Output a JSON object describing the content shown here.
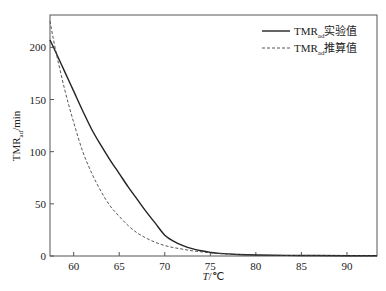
{
  "chart_data": {
    "type": "line",
    "title": "",
    "xlabel": "T/℃",
    "ylabel": "TMRad/min",
    "xlim": [
      57.4,
      93.3
    ],
    "ylim": [
      0,
      231
    ],
    "xticks": [
      60,
      65,
      70,
      75,
      80,
      85,
      90
    ],
    "yticks": [
      0,
      50,
      100,
      150,
      200
    ],
    "grid": false,
    "legend_position": "upper right",
    "series": [
      {
        "name": "TMRad实验值",
        "style": "solid",
        "color": "#222222",
        "x": [
          57.4,
          58,
          59,
          60,
          61,
          62,
          63,
          64,
          65,
          66,
          67,
          68,
          69,
          70,
          71,
          72,
          73,
          74,
          75,
          76,
          78,
          80,
          85,
          90,
          93.3
        ],
        "y": [
          207,
          196,
          177,
          158,
          139,
          121,
          106,
          92,
          79,
          66,
          54,
          42,
          31,
          20,
          14,
          10,
          7,
          5,
          3.5,
          2.5,
          1.5,
          1,
          0.5,
          0.3,
          0.2
        ]
      },
      {
        "name": "TMRad推算值",
        "style": "dashed",
        "color": "#444444",
        "x": [
          57.4,
          58,
          59,
          60,
          61,
          62,
          63,
          64,
          65,
          66,
          67,
          68,
          69,
          70,
          71,
          72,
          73,
          74,
          75,
          76,
          78,
          80,
          85,
          90,
          93.3
        ],
        "y": [
          225,
          198,
          160,
          128,
          100,
          79,
          62,
          48,
          38,
          29,
          22,
          17,
          13,
          10,
          8,
          6.5,
          5,
          4,
          3,
          2.3,
          1.4,
          0.9,
          0.4,
          0.2,
          0.1
        ]
      }
    ]
  },
  "labels": {
    "x_axis": "T/℃",
    "x_axis_italic": "T",
    "x_axis_unit": "/℃",
    "y_axis_main": "TMR",
    "y_axis_sub": "ad",
    "y_axis_unit": "/min",
    "legend": [
      {
        "main": "TMR",
        "sub": "ad",
        "suffix": "实验值"
      },
      {
        "main": "TMR",
        "sub": "ad",
        "suffix": "推算值"
      }
    ]
  }
}
